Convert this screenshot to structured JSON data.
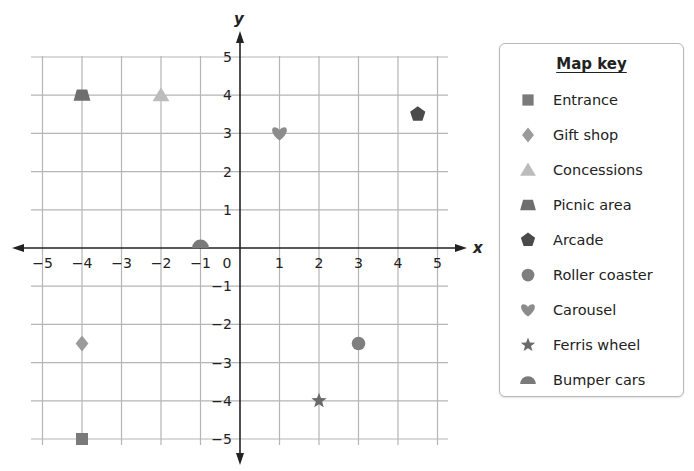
{
  "chart_data": {
    "type": "scatter",
    "title": "",
    "xlabel": "x",
    "ylabel": "y",
    "xlim": [
      -5,
      5
    ],
    "ylim": [
      -5,
      5
    ],
    "grid": true,
    "x_ticks": [
      "-5",
      "-4",
      "-3",
      "-2",
      "-1",
      "0",
      "1",
      "2",
      "3",
      "4",
      "5"
    ],
    "y_ticks": [
      "5",
      "4",
      "3",
      "2",
      "1",
      "-1",
      "-2",
      "-3",
      "-4",
      "-5"
    ],
    "legend_position": "right",
    "series": [
      {
        "name": "Entrance",
        "marker": "square",
        "color": "#7a7a7a",
        "x": -4,
        "y": -5
      },
      {
        "name": "Gift shop",
        "marker": "diamond",
        "color": "#9a9a9a",
        "x": -4,
        "y": -2.5
      },
      {
        "name": "Concessions",
        "marker": "triangle",
        "color": "#bcbcbc",
        "x": -2,
        "y": 4
      },
      {
        "name": "Picnic area",
        "marker": "trapezoid",
        "color": "#6e6e6e",
        "x": -4,
        "y": 4
      },
      {
        "name": "Arcade",
        "marker": "pentagon",
        "color": "#4a4a4a",
        "x": 4.5,
        "y": 3.5
      },
      {
        "name": "Roller coaster",
        "marker": "circle",
        "color": "#7f7f7f",
        "x": 3,
        "y": -2.5
      },
      {
        "name": "Carousel",
        "marker": "heart",
        "color": "#8c8c8c",
        "x": 1,
        "y": 3
      },
      {
        "name": "Ferris wheel",
        "marker": "star",
        "color": "#6a6a6a",
        "x": 2,
        "y": -4
      },
      {
        "name": "Bumper cars",
        "marker": "semicircle",
        "color": "#7a7a7a",
        "x": -1,
        "y": 0
      }
    ]
  },
  "legend": {
    "title": "Map key",
    "items": [
      {
        "label": "Entrance"
      },
      {
        "label": "Gift shop"
      },
      {
        "label": "Concessions"
      },
      {
        "label": "Picnic area"
      },
      {
        "label": "Arcade"
      },
      {
        "label": "Roller coaster"
      },
      {
        "label": "Carousel"
      },
      {
        "label": "Ferris wheel"
      },
      {
        "label": "Bumper cars"
      }
    ]
  },
  "axes": {
    "x_label": "x",
    "y_label": "y",
    "origin_label": "0"
  },
  "colors": {
    "grid": "#b5b5b5",
    "axis": "#222222"
  }
}
